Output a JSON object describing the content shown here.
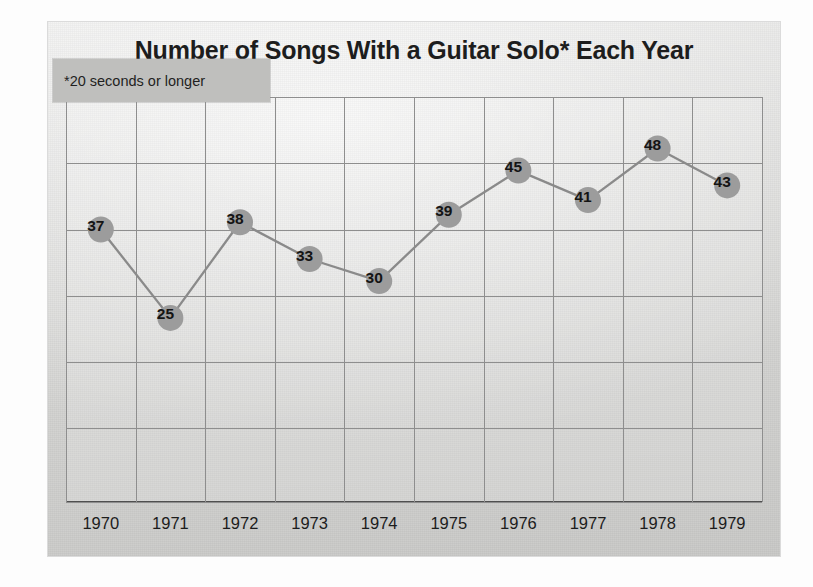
{
  "chart_data": {
    "type": "line",
    "title": "Number of Songs With a Guitar Solo* Each Year",
    "footnote": "*20 seconds or longer",
    "xlabel": "",
    "ylabel": "",
    "categories": [
      "1970",
      "1971",
      "1972",
      "1973",
      "1974",
      "1975",
      "1976",
      "1977",
      "1978",
      "1979"
    ],
    "values": [
      37,
      25,
      38,
      33,
      30,
      39,
      45,
      41,
      48,
      43
    ],
    "series": [
      {
        "name": "Number of Songs With a Guitar Solo",
        "values": [
          37,
          25,
          38,
          33,
          30,
          39,
          45,
          41,
          48,
          43
        ]
      }
    ],
    "point_labels": [
      "37",
      "25",
      "38",
      "33",
      "30",
      "39",
      "45",
      "41",
      "48",
      "43"
    ],
    "ylim": [
      0,
      55
    ],
    "y_gridline_values": [
      55,
      46,
      37,
      28,
      19,
      10,
      0
    ],
    "grid": true,
    "legend": "none",
    "marker": "circle",
    "colors": {
      "line": "#8a8a8a",
      "marker_fill": "#9c9c9c",
      "label_text": "#141414",
      "grid": "#8e8e8e",
      "axis": "#4f4f4f",
      "card_background": "#d9d9d7",
      "footnote_background": "#bfbfbd",
      "title_text": "#1d1d1d"
    }
  }
}
